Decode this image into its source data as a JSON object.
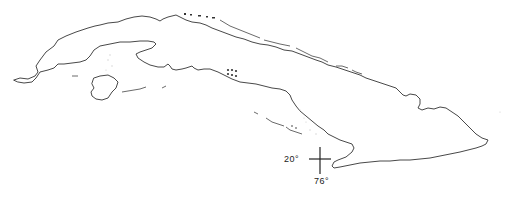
{
  "map": {
    "subject": "Cuba outline map",
    "graticule": {
      "latitude_label": "20°",
      "longitude_label": "76°"
    },
    "colors": {
      "background": "#ffffff",
      "coastline": "#333333"
    }
  }
}
